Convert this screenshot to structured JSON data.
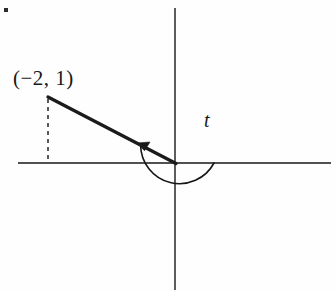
{
  "figure": {
    "type": "trigonometry-angle-diagram",
    "background_color": "#fefefe",
    "ink_color": "#171717",
    "width": 336,
    "height": 290,
    "corner_mark": {
      "name": "corner-dot",
      "x": 4,
      "y": 8,
      "size": 4
    },
    "axes": {
      "origin": {
        "x": 175,
        "y": 163
      },
      "x_axis": {
        "x1": 18,
        "y1": 163,
        "x2": 331,
        "y2": 163,
        "stroke_width": 1.4
      },
      "y_axis": {
        "x1": 175,
        "y1": 8,
        "x2": 175,
        "y2": 290,
        "stroke_width": 1.4
      }
    },
    "terminal_ray": {
      "label": "terminal-side",
      "from": {
        "x": 175,
        "y": 163
      },
      "to": {
        "x": 48,
        "y": 97
      },
      "stroke_width": 3.2
    },
    "reference_drop": {
      "label": "dashed-perpendicular",
      "x": 48,
      "y_top": 99,
      "y_bottom": 163,
      "dash": "4 4",
      "stroke_width": 1.6
    },
    "angle_arc": {
      "label": "angle-arc",
      "center": {
        "x": 175,
        "y": 163
      },
      "radius": 39,
      "start_angle_deg": 0,
      "end_angle_deg": 152,
      "direction": "counterclockwise",
      "stroke_width": 1.6,
      "arrow_tip": {
        "x": 140,
        "y": 144
      }
    },
    "labels": {
      "point": "(−2, 1)",
      "angle": "t"
    }
  }
}
